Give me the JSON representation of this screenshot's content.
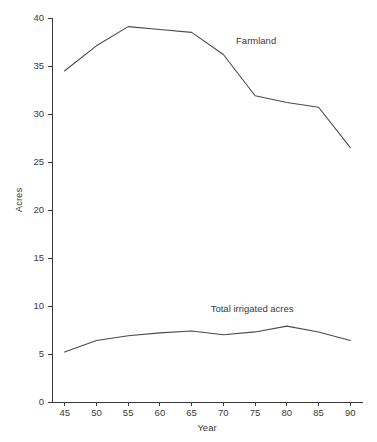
{
  "chart_data": {
    "type": "line",
    "title": "",
    "subtitle": "",
    "xlabel": "Year",
    "ylabel": "Acres",
    "x": [
      45,
      50,
      55,
      60,
      65,
      70,
      75,
      80,
      85,
      90
    ],
    "xtick_labels": [
      "45",
      "50",
      "55",
      "60",
      "65",
      "70",
      "75",
      "80",
      "85",
      "90"
    ],
    "ytick_labels": [
      "0",
      "5",
      "10",
      "15",
      "20",
      "25",
      "30",
      "35",
      "40"
    ],
    "ytick_values": [
      0,
      5,
      10,
      15,
      20,
      25,
      30,
      35,
      40
    ],
    "xlim": [
      43,
      92
    ],
    "ylim": [
      0,
      40
    ],
    "grid": false,
    "legend_position": "inline-annotations",
    "series": [
      {
        "name": "Farmland",
        "label": "Farmland",
        "label_x": 72,
        "label_y": 37.3,
        "color": "#4a4a4a",
        "values": [
          34.5,
          37.1,
          39.1,
          38.8,
          38.5,
          36.2,
          31.9,
          31.2,
          30.7,
          26.5
        ]
      },
      {
        "name": "Total irrigated acres",
        "label": "Total irrigated acres",
        "label_x": 68,
        "label_y": 9.4,
        "color": "#4a4a4a",
        "values": [
          5.2,
          6.4,
          6.9,
          7.2,
          7.4,
          7.0,
          7.3,
          7.9,
          7.3,
          6.4
        ]
      }
    ],
    "annotations": [
      {
        "text": "Farmland",
        "x": 72,
        "y": 37.3
      },
      {
        "text": "Total irrigated acres",
        "x": 68,
        "y": 9.4
      }
    ]
  }
}
